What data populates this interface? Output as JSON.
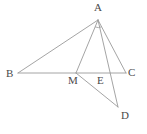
{
  "figure": {
    "kind": "euclidean-geometry-diagram",
    "background_color": "#ffffff",
    "stroke_color": "#9a9a9a",
    "label_color": "#4a4a4a",
    "canvas": {
      "width": 147,
      "height": 134
    }
  },
  "points": [
    {
      "id": "A",
      "label": "A",
      "x": 98,
      "y": 20,
      "label_x": 94,
      "label_y": 2
    },
    {
      "id": "B",
      "label": "B",
      "x": 18,
      "y": 73,
      "label_x": 6,
      "label_y": 68
    },
    {
      "id": "M",
      "label": "M",
      "x": 76,
      "y": 73,
      "label_x": 68,
      "label_y": 75
    },
    {
      "id": "E",
      "label": "E",
      "x": 103,
      "y": 73,
      "label_x": 97,
      "label_y": 75
    },
    {
      "id": "C",
      "label": "C",
      "x": 126,
      "y": 73,
      "label_x": 128,
      "label_y": 67
    },
    {
      "id": "D",
      "label": "D",
      "x": 118,
      "y": 107,
      "label_x": 121,
      "label_y": 110
    }
  ],
  "segments": [
    {
      "id": "AB",
      "from": "A",
      "to": "B",
      "name": "segment-ab"
    },
    {
      "id": "AC",
      "from": "A",
      "to": "C",
      "name": "segment-ac"
    },
    {
      "id": "BC",
      "from": "B",
      "to": "C",
      "name": "segment-bc"
    },
    {
      "id": "AM",
      "from": "A",
      "to": "M",
      "name": "segment-am"
    },
    {
      "id": "AD",
      "from": "A",
      "to": "D",
      "name": "segment-ad"
    },
    {
      "id": "MD",
      "from": "M",
      "to": "D",
      "name": "segment-md"
    }
  ],
  "angle_markers": [
    {
      "id": "angle-at-A",
      "vertex": "A",
      "name": "angle-arc-at-a"
    }
  ]
}
